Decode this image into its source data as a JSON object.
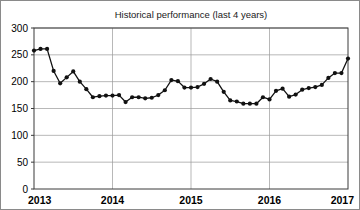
{
  "chart_data": {
    "type": "line",
    "title": "Historical performance (last 4 years)",
    "xlabel": "",
    "ylabel": "",
    "xlim": [
      2013,
      2017
    ],
    "ylim": [
      0,
      300
    ],
    "yticks": [
      0,
      50,
      100,
      150,
      200,
      250,
      300
    ],
    "ytick_labels": [
      "0",
      "50",
      "100",
      "150",
      "200",
      "250",
      "300"
    ],
    "xticks": [
      2013,
      2014,
      2015,
      2016,
      2017
    ],
    "xtick_labels": [
      "2013",
      "2014",
      "2015",
      "2016",
      "2017"
    ],
    "grid": "horizontal-and-vertical",
    "legend": "none",
    "marker": "filled-circle",
    "series": [
      {
        "name": "performance",
        "color": "#111111",
        "x": [
          2013.0,
          2013.0833,
          2013.1667,
          2013.25,
          2013.3333,
          2013.4167,
          2013.5,
          2013.5833,
          2013.6667,
          2013.75,
          2013.8333,
          2013.9167,
          2014.0,
          2014.0833,
          2014.1667,
          2014.25,
          2014.3333,
          2014.4167,
          2014.5,
          2014.5833,
          2014.6667,
          2014.75,
          2014.8333,
          2014.9167,
          2015.0,
          2015.0833,
          2015.1667,
          2015.25,
          2015.3333,
          2015.4167,
          2015.5,
          2015.5833,
          2015.6667,
          2015.75,
          2015.8333,
          2015.9167,
          2016.0,
          2016.0833,
          2016.1667,
          2016.25,
          2016.3333,
          2016.4167,
          2016.5,
          2016.5833,
          2016.6667,
          2016.75,
          2016.8333,
          2016.9167,
          2017.0
        ],
        "values": [
          258,
          261,
          261,
          220,
          197,
          208,
          219,
          200,
          186,
          171,
          173,
          174,
          174,
          175,
          162,
          171,
          171,
          169,
          170,
          175,
          184,
          203,
          201,
          189,
          189,
          190,
          196,
          205,
          200,
          181,
          165,
          163,
          159,
          159,
          159,
          171,
          167,
          183,
          187,
          172,
          176,
          185,
          188,
          190,
          194,
          207,
          216,
          216,
          243
        ]
      }
    ]
  },
  "figure": {
    "background_color": "#ffffff",
    "border_color": "#8a8a8a",
    "grid_color": "#9a9a9a",
    "axis_color": "#3a3a3a"
  }
}
